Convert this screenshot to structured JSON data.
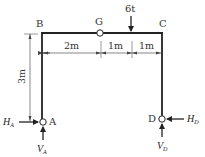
{
  "diagram": {
    "type": "three-hinged portal frame",
    "nodes": {
      "A": "A",
      "B": "B",
      "C": "C",
      "D": "D",
      "G": "G"
    },
    "load": {
      "label": "6t",
      "direction": "down"
    },
    "dimensions": {
      "span_1": "2m",
      "span_2": "1m",
      "span_3": "1m",
      "height": "3m"
    },
    "reactions": {
      "HA_main": "H",
      "HA_sub": "A",
      "VA_main": "V",
      "VA_sub": "A",
      "HD_main": "H",
      "HD_sub": "D",
      "VD_main": "V",
      "VD_sub": "D"
    },
    "colors": {
      "line": "#222222",
      "dim": "#555555",
      "text": "#333333"
    }
  }
}
